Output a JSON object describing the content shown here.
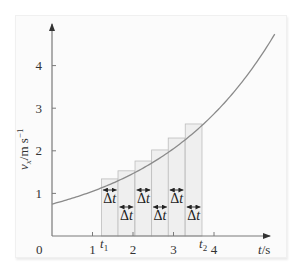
{
  "chart_data": {
    "type": "area",
    "title": "",
    "xlabel": "t/s",
    "ylabel": "v_x/m s^-1",
    "xlim": [
      0,
      5.5
    ],
    "ylim": [
      0,
      4.8
    ],
    "x_ticks": [
      1,
      2,
      3,
      4
    ],
    "y_ticks": [
      1,
      2,
      3,
      4
    ],
    "origin_label": "0",
    "grid": false,
    "curve": {
      "name": "v_x(t)",
      "description": "exponentially increasing velocity",
      "x": [
        0,
        0.5,
        1,
        1.5,
        2,
        2.5,
        3,
        3.5,
        4,
        4.5,
        5,
        5.5
      ],
      "y": [
        0.75,
        0.89,
        1.05,
        1.24,
        1.47,
        1.74,
        2.05,
        2.43,
        2.87,
        3.4,
        4.01,
        4.74
      ]
    },
    "rectangles": {
      "description": "six strips of width Δt between t1 and t2 (upper Riemann sum)",
      "t1": 1.22,
      "t2": 3.7,
      "delta_t": 0.413,
      "left_edges": [
        1.22,
        1.63,
        2.05,
        2.46,
        2.87,
        3.29
      ],
      "heights": [
        1.34,
        1.53,
        1.76,
        2.02,
        2.3,
        2.63
      ],
      "strip_label": "Δt"
    },
    "annotations": [
      "t1",
      "t2"
    ]
  },
  "labels": {
    "origin": "0",
    "x_ticks": [
      "1",
      "2",
      "3",
      "4"
    ],
    "y_ticks": [
      "1",
      "2",
      "3",
      "4"
    ],
    "t1_main": "t",
    "t1_sub": "1",
    "t2_main": "t",
    "t2_sub": "2",
    "xlabel_var": "t",
    "xlabel_unit": "/s",
    "ylabel_var": "v",
    "ylabel_sub": "x",
    "ylabel_unit": "/m s",
    "ylabel_exp": "−1",
    "dt": "Δt"
  },
  "colors": {
    "curve": "#8a8a8a",
    "axis": "#7a7a7a",
    "bar_fill": "#efefef",
    "bar_stroke": "#bdbdbd"
  }
}
